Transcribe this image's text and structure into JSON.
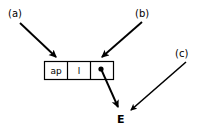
{
  "figure": {
    "type": "cons-cell-pointer-diagram",
    "background_color": "#ffffff",
    "stroke_color": "#000000"
  },
  "callouts": [
    {
      "id": "a",
      "label": "(a)",
      "x": 8,
      "y": 8,
      "target": "cell-ap"
    },
    {
      "id": "b",
      "label": "(b)",
      "x": 135,
      "y": 8,
      "target": "cell-pointer"
    },
    {
      "id": "c",
      "label": "(c)",
      "x": 175,
      "y": 48,
      "target": "node-e"
    }
  ],
  "record_box": {
    "x": 44,
    "y": 61,
    "width": 70,
    "height": 18,
    "cells": [
      {
        "name": "cell-ap",
        "text": "ap",
        "kind": "text"
      },
      {
        "name": "cell-l",
        "text": "l",
        "kind": "text"
      },
      {
        "name": "cell-pointer",
        "text": "",
        "kind": "pointer-dot"
      }
    ]
  },
  "pointer_dot": {
    "cx": 101,
    "cy": 69,
    "r": 2.6
  },
  "node": {
    "name": "node-e",
    "label": "E",
    "x": 120,
    "y": 122
  },
  "arrows": [
    {
      "name": "arrow-a",
      "from": [
        20,
        23
      ],
      "to": [
        57,
        58
      ],
      "label": "(a)"
    },
    {
      "name": "arrow-b",
      "from": [
        142,
        22
      ],
      "to": [
        101,
        58
      ],
      "label": "(b)"
    },
    {
      "name": "arrow-c",
      "from": [
        186,
        62
      ],
      "to": [
        130,
        110
      ],
      "label": "(c)"
    },
    {
      "name": "arrow-pointer",
      "from": [
        101,
        69
      ],
      "to": [
        118,
        108
      ],
      "label": ""
    }
  ]
}
